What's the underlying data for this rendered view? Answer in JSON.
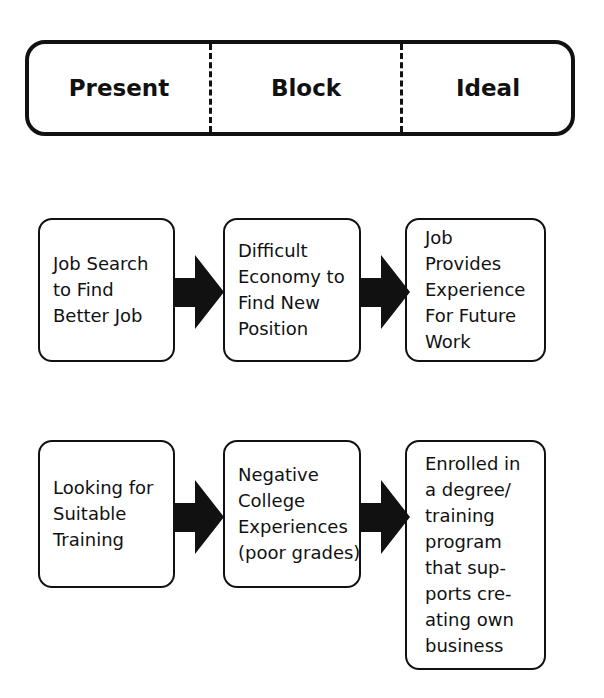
{
  "header": {
    "columns": [
      "Present",
      "Block",
      "Ideal"
    ]
  },
  "rows": [
    {
      "present": [
        "Job Search",
        "to Find",
        "Better Job"
      ],
      "block": [
        "Difficult",
        "Economy to",
        "Find New",
        "Position"
      ],
      "ideal": [
        "Job",
        "Provides",
        "Experience",
        "For Future",
        "Work"
      ]
    },
    {
      "present": [
        "Looking for",
        "Suitable",
        "Training"
      ],
      "block": [
        "Negative",
        "College",
        "Experiences",
        "(poor grades)"
      ],
      "ideal": [
        "Enrolled in",
        "a degree/",
        "training",
        "program",
        "that sup-",
        "ports cre-",
        "ating own",
        "business"
      ]
    }
  ],
  "colors": {
    "stroke": "#111111",
    "background": "#ffffff"
  }
}
